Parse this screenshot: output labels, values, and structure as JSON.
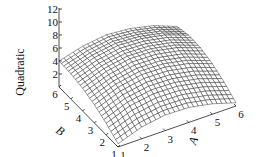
{
  "chart_data": {
    "type": "surface",
    "title": "",
    "zlabel": "Quadratic",
    "xlabel": "A",
    "ylabel": "B",
    "x": [
      1,
      2,
      3,
      4,
      5,
      6
    ],
    "y": [
      1,
      2,
      3,
      4,
      5,
      6
    ],
    "z_ticks": [
      2,
      4,
      6,
      8,
      10,
      12
    ],
    "x_ticks": [
      1,
      2,
      3,
      4,
      5,
      6
    ],
    "y_ticks": [
      1,
      2,
      3,
      4,
      5,
      6
    ],
    "zlim": [
      0,
      12
    ],
    "xlim": [
      1,
      6
    ],
    "ylim": [
      1,
      6
    ],
    "z_grid_by_A": [
      [
        0.5,
        1.8,
        2.8,
        3.5,
        3.9,
        4.0
      ],
      [
        1.8,
        3.2,
        4.2,
        4.8,
        5.1,
        5.0
      ],
      [
        2.4,
        3.8,
        4.9,
        5.5,
        5.7,
        5.5
      ],
      [
        2.3,
        3.7,
        4.8,
        5.4,
        5.5,
        5.2
      ],
      [
        1.6,
        3.0,
        4.1,
        4.7,
        4.8,
        4.4
      ],
      [
        0.5,
        1.8,
        2.8,
        3.4,
        3.5,
        3.0
      ]
    ],
    "mesh_color": "#222222",
    "face_color": "#ffffff"
  }
}
